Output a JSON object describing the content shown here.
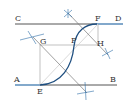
{
  "diagram": {
    "type": "geometric-construction",
    "labels": {
      "A": "A",
      "B": "B",
      "C": "C",
      "D": "D",
      "E": "E",
      "F": "F",
      "G": "G",
      "H": "H",
      "P": "P"
    },
    "colors": {
      "line": "#555555",
      "construction": "#8a8a8a",
      "accent": "#2f6fa8",
      "arc": "#1f4f80",
      "faint": "#c8c8c8"
    }
  }
}
